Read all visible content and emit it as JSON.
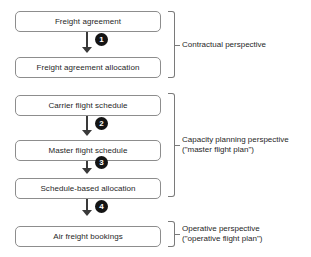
{
  "diagram": {
    "nodes": [
      {
        "id": "freight-agreement",
        "label": "Freight agreement",
        "top": 11,
        "group": "contractual"
      },
      {
        "id": "freight-agreement-allocation",
        "label": "Freight agreement allocation",
        "top": 57,
        "group": "contractual"
      },
      {
        "id": "carrier-flight-schedule",
        "label": "Carrier flight schedule",
        "top": 95,
        "group": "capacity"
      },
      {
        "id": "master-flight-schedule",
        "label": "Master flight schedule",
        "top": 140,
        "group": "capacity"
      },
      {
        "id": "schedule-based-allocation",
        "label": "Schedule-based allocation",
        "top": 178,
        "group": "capacity"
      },
      {
        "id": "air-freight-bookings",
        "label": "Air freight bookings",
        "top": 226,
        "group": "operative"
      }
    ],
    "steps": [
      {
        "number": "1",
        "from": "freight-agreement",
        "to": "freight-agreement-allocation",
        "line_top": 32,
        "line_height": 19,
        "head_top": 47,
        "badge_top": 33
      },
      {
        "number": "2",
        "from": "carrier-flight-schedule",
        "to": "master-flight-schedule",
        "line_top": 116,
        "line_height": 18,
        "head_top": 130,
        "badge_top": 117
      },
      {
        "number": "3",
        "from": "master-flight-schedule",
        "to": "schedule-based-allocation",
        "line_top": 161,
        "line_height": 11,
        "head_top": 168,
        "badge_top": 156
      },
      {
        "number": "4",
        "from": "schedule-based-allocation",
        "to": "air-freight-bookings",
        "line_top": 199,
        "line_height": 14,
        "head_top": 210,
        "badge_top": 200
      }
    ],
    "groups": [
      {
        "id": "contractual",
        "caption": "Contractual perspective",
        "subcaption": "",
        "bracket_top": 11,
        "bracket_height": 67,
        "tick_top": 45,
        "caption_top": 40
      },
      {
        "id": "capacity",
        "caption": "Capacity planning perspective",
        "subcaption": "(\"master flight plan\")",
        "bracket_top": 93,
        "bracket_height": 104,
        "tick_top": 145,
        "caption_top": 135
      },
      {
        "id": "operative",
        "caption": "Operative perspective",
        "subcaption": "(\"operative flight plan\")",
        "bracket_top": 221,
        "bracket_height": 26,
        "tick_top": 234,
        "caption_top": 224
      }
    ],
    "colors": {
      "box_border": "#8d8d8d",
      "arrow": "#3a3a3a",
      "badge_fill": "#141414",
      "badge_text": "#ffffff",
      "bracket": "#7a7a7a",
      "text": "#1f1f1f",
      "background": "#ffffff"
    }
  }
}
